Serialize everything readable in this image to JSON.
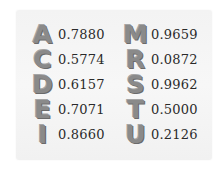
{
  "table": {
    "left": [
      {
        "letter": "A",
        "value": "0.7880"
      },
      {
        "letter": "C",
        "value": "0.5774"
      },
      {
        "letter": "D",
        "value": "0.6157"
      },
      {
        "letter": "E",
        "value": "0.7071"
      },
      {
        "letter": "I",
        "value": "0.8660"
      }
    ],
    "right": [
      {
        "letter": "M",
        "value": "0.9659"
      },
      {
        "letter": "R",
        "value": "0.0872"
      },
      {
        "letter": "S",
        "value": "0.9962"
      },
      {
        "letter": "T",
        "value": "0.5000"
      },
      {
        "letter": "U",
        "value": "0.2126"
      }
    ]
  },
  "colors": {
    "glyph": "#8a8a8a",
    "text": "#2a2a2a",
    "paper": "#f4f4f4"
  }
}
